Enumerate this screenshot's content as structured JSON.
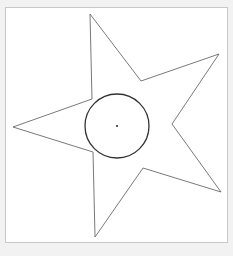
{
  "canvas": {
    "background": "#ffffff",
    "page_background": "#f2f2f2",
    "frame_border_color": "#c8c8c8",
    "frame": {
      "x": 5,
      "y": 7,
      "width": 223,
      "height": 236
    }
  },
  "shapes": {
    "star": {
      "type": "polygon",
      "points": "90,14 141,81 219,54 172,124 221,192 143,168 95,237 93,152 13,127 92,99",
      "stroke": "#6a6a6a",
      "stroke_width": "0.9",
      "fill": "none"
    },
    "circle": {
      "type": "circle",
      "cx": "117",
      "cy": "126",
      "r": "32",
      "stroke": "#333333",
      "stroke_width": "1.3",
      "fill": "none"
    },
    "center_point": {
      "type": "dot",
      "cx": "117",
      "cy": "126",
      "r": "1",
      "fill": "#222222"
    }
  }
}
